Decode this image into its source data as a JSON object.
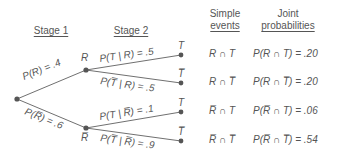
{
  "headers": {
    "stage1": "Stage 1",
    "stage2": "Stage 2",
    "simple_line1": "Simple",
    "simple_line2": "events",
    "joint_line1": "Joint",
    "joint_line2": "probabilities"
  },
  "nodes": {
    "root": {
      "x": 17,
      "y": 99
    },
    "R": {
      "x": 86,
      "y": 70,
      "label": "R"
    },
    "Rbar": {
      "x": 86,
      "y": 128,
      "label": "R̅"
    },
    "T1": {
      "x": 181,
      "y": 55,
      "label": "T"
    },
    "Tbar1": {
      "x": 181,
      "y": 83,
      "label": "T̅"
    },
    "T2": {
      "x": 181,
      "y": 112,
      "label": "T"
    },
    "Tbar2": {
      "x": 181,
      "y": 141,
      "label": "T̅"
    }
  },
  "branches": {
    "pR": "P(R) = .4",
    "pRbar": "P(R̅) = .6",
    "pT_R": "P(T | R) = .5",
    "pTbar_R": "P(T̅ | R) = .5",
    "pT_Rbar": "P(T | R̅) = .1",
    "pTbar_Rbar": "P(T̅ | R̅) = .9"
  },
  "rows": [
    {
      "event": "R ∩ T",
      "joint": "P(R ∩ T) = .20"
    },
    {
      "event": "R ∩ T̅",
      "joint": "P(R ∩ T̅) = .20"
    },
    {
      "event": "R̅ ∩ T",
      "joint": "P(R̅ ∩ T) = .06"
    },
    {
      "event": "R̅ ∩ T̅",
      "joint": "P(R̅ ∩ T̅) = .54"
    }
  ],
  "colors": {
    "line": "#707070",
    "node": "#555555",
    "text": "#555555"
  }
}
